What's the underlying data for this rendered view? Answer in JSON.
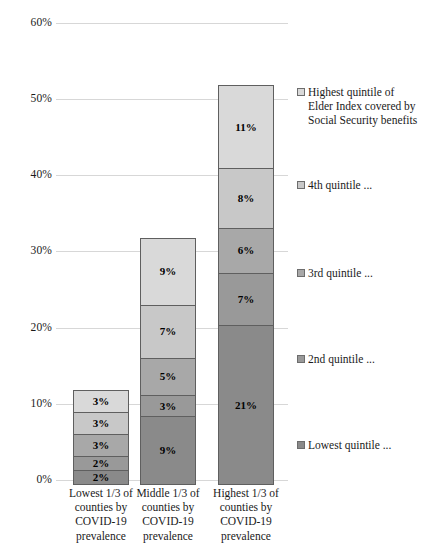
{
  "chart_data": {
    "type": "bar",
    "stacked": true,
    "title": "",
    "subtitle": "",
    "xlabel": "",
    "ylabel": "",
    "ylim": [
      0,
      60
    ],
    "y_tick_labels": [
      "0%",
      "10%",
      "20%",
      "30%",
      "40%",
      "50%",
      "60%"
    ],
    "y_tick_values": [
      0,
      10,
      20,
      30,
      40,
      50,
      60
    ],
    "grid": true,
    "legend_position": "right",
    "categories": [
      "Lowest 1/3 of counties by COVID-19 prevalence",
      "Middle 1/3 of counties by COVID-19 prevalence",
      "Highest 1/3 of counties by COVID-19 prevalence"
    ],
    "category_lines": [
      [
        "Lowest 1/3 of",
        "counties by",
        "COVID-19",
        "prevalence"
      ],
      [
        "Middle 1/3 of",
        "counties by",
        "COVID-19",
        "prevalence"
      ],
      [
        "Highest 1/3 of",
        "counties by",
        "COVID-19",
        "prevalence"
      ]
    ],
    "series": [
      {
        "name": "Lowest quintile ...",
        "legend_lines": [
          "Lowest quintile ..."
        ],
        "color": "#8a8a8a",
        "values": [
          2,
          9,
          21
        ],
        "labels": [
          "2%",
          "9%",
          "21%"
        ]
      },
      {
        "name": "2nd quintile ...",
        "legend_lines": [
          "2nd quintile ..."
        ],
        "color": "#999999",
        "values": [
          2,
          3,
          7
        ],
        "labels": [
          "2%",
          "3%",
          "7%"
        ]
      },
      {
        "name": "3rd quintile ...",
        "legend_lines": [
          "3rd quintile ..."
        ],
        "color": "#a8a8a8",
        "values": [
          3,
          5,
          6
        ],
        "labels": [
          "3%",
          "5%",
          "6%"
        ]
      },
      {
        "name": "4th quintile ...",
        "legend_lines": [
          "4th quintile ..."
        ],
        "color": "#c8c8c8",
        "values": [
          3,
          7,
          8
        ],
        "labels": [
          "3%",
          "7%",
          "8%"
        ]
      },
      {
        "name": "Highest quintile of Elder Index covered by Social Security benefits",
        "legend_lines": [
          "Highest quintile of",
          "Elder Index covered by",
          "Social Security benefits"
        ],
        "color": "#d9d9d9",
        "values": [
          3,
          9,
          11
        ],
        "labels": [
          "3%",
          "9%",
          "11%"
        ]
      }
    ],
    "totals": [
      13,
      33,
      53
    ]
  },
  "axis": {
    "ticks": [
      {
        "label": "60%",
        "value": 60
      },
      {
        "label": "50%",
        "value": 50
      },
      {
        "label": "40%",
        "value": 40
      },
      {
        "label": "30%",
        "value": 30
      },
      {
        "label": "20%",
        "value": 20
      },
      {
        "label": "10%",
        "value": 10
      },
      {
        "label": "0%",
        "value": 0
      }
    ]
  }
}
